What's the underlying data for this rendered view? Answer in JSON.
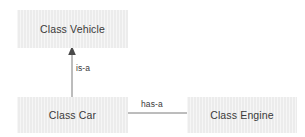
{
  "diagram": {
    "type": "uml-class-relationship-diagram",
    "background_color": "#ffffff",
    "box_fill_color": "#ececec",
    "text_color": "#3a3a3a",
    "line_color": "#7a7a7a",
    "nodes": [
      {
        "id": "vehicle",
        "label": "Class Vehicle",
        "x": 17,
        "y": 10,
        "width": 111,
        "height": 38
      },
      {
        "id": "car",
        "label": "Class Car",
        "x": 17,
        "y": 97,
        "width": 111,
        "height": 36
      },
      {
        "id": "engine",
        "label": "Class Engine",
        "x": 187,
        "y": 97,
        "width": 110,
        "height": 36
      }
    ],
    "edges": [
      {
        "id": "is-a",
        "label": "is-a",
        "from": "car",
        "to": "vehicle",
        "orientation": "vertical",
        "arrowhead": "solid-triangle-up"
      },
      {
        "id": "has-a",
        "label": "has-a",
        "from": "car",
        "to": "engine",
        "orientation": "horizontal",
        "arrowhead": "none"
      }
    ]
  }
}
